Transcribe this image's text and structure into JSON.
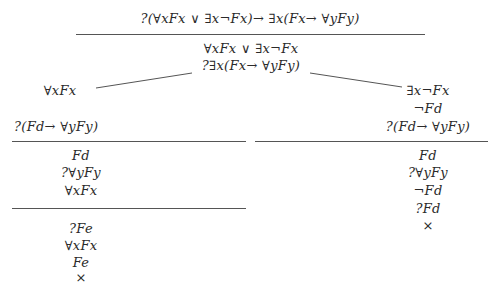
{
  "tree": {
    "root": {
      "goal": "?(∀xFx ∨ ∃x¬Fx)→ ∃x(Fx→ ∀yFy)",
      "lines": [
        "∀xFx ∨ ∃x¬Fx",
        "?∃x(Fx→ ∀yFy)"
      ]
    },
    "left_branch": {
      "head": "∀xFx",
      "goal": "?(Fd→ ∀yFy)",
      "step1": [
        "Fd",
        "?∀yFy",
        "∀xFx"
      ],
      "step2": [
        "?Fe",
        "∀xFx",
        "Fe",
        "×"
      ]
    },
    "right_branch": {
      "lines": [
        "∃x¬Fx",
        "¬Fd",
        "?(Fd→ ∀yFy)"
      ],
      "step1": [
        "Fd",
        "?∀yFy",
        "¬Fd",
        "?Fd",
        "×"
      ]
    }
  },
  "colors": {
    "ink": "#2a2a2a",
    "rule": "#555555",
    "background": "#ffffff"
  }
}
